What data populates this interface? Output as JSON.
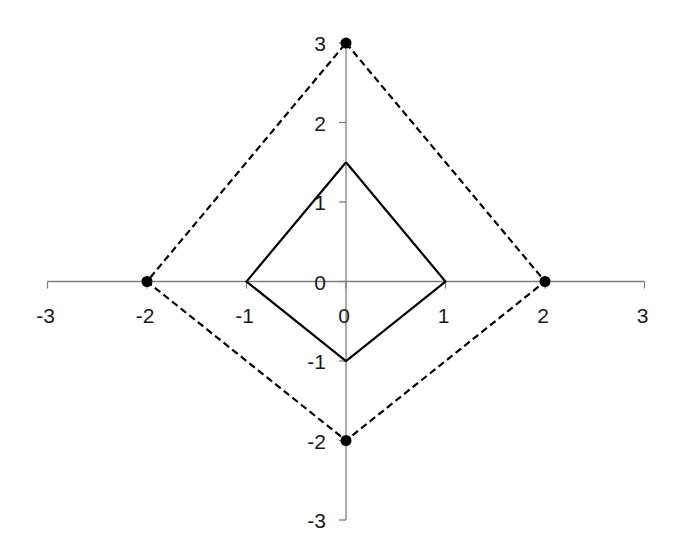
{
  "chart_data": {
    "type": "line",
    "title": "",
    "xlabel": "",
    "ylabel": "",
    "xlim": [
      -3,
      3
    ],
    "ylim": [
      -3,
      3
    ],
    "grid": false,
    "legend": null,
    "x_ticks": [
      "-3",
      "-2",
      "-1",
      "0",
      "1",
      "2",
      "3"
    ],
    "y_ticks": [
      "3",
      "2",
      "1",
      "0",
      "-1",
      "-2",
      "-3"
    ],
    "series": [
      {
        "name": "outer-quadrilateral",
        "style": "dashed",
        "markers": true,
        "color": "#000000",
        "points": [
          [
            0,
            3
          ],
          [
            2,
            0
          ],
          [
            0,
            -2
          ],
          [
            -2,
            0
          ],
          [
            0,
            3
          ]
        ]
      },
      {
        "name": "inner-quadrilateral",
        "style": "solid",
        "markers": false,
        "color": "#000000",
        "points": [
          [
            0,
            1.5
          ],
          [
            1,
            0
          ],
          [
            0,
            -1
          ],
          [
            -1,
            0
          ],
          [
            0,
            1.5
          ]
        ]
      }
    ],
    "axis_color": "#7f7f7f"
  }
}
